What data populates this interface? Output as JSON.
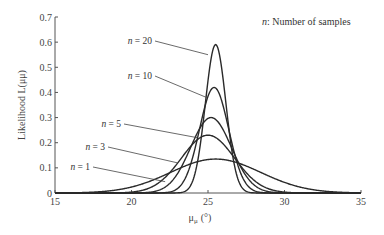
{
  "chart_data": {
    "type": "line",
    "title": "",
    "annotation": "n: Number of samples",
    "annotation_italic": "n",
    "annotation_rest": ": Number of samples",
    "xlabel": "μμ (°)",
    "xlabel_main": "μ",
    "xlabel_sub": "μ",
    "xlabel_unit": "(°)",
    "ylabel": "Likelihood L(μμ)",
    "xlim": [
      15,
      35
    ],
    "ylim": [
      0,
      0.7
    ],
    "xticks": [
      "15",
      "20",
      "25",
      "30",
      "35"
    ],
    "yticks": [
      "0",
      "0.1",
      "0.2",
      "0.3",
      "0.4",
      "0.5",
      "0.6",
      "0.7"
    ],
    "grid": false,
    "legend": "inline labels",
    "series": [
      {
        "name": "n = 1",
        "center": 25.5,
        "peak": 0.135,
        "sigma": 2.95
      },
      {
        "name": "n = 3",
        "center": 25.0,
        "peak": 0.23,
        "sigma": 1.73
      },
      {
        "name": "n = 5",
        "center": 25.2,
        "peak": 0.3,
        "sigma": 1.33
      },
      {
        "name": "n = 10",
        "center": 25.4,
        "peak": 0.42,
        "sigma": 0.95
      },
      {
        "name": "n = 20",
        "center": 25.5,
        "peak": 0.59,
        "sigma": 0.67
      }
    ],
    "series_labels": [
      {
        "text": "n = 1",
        "lx": 90,
        "ly": 170,
        "ax": 22.2,
        "ay": 0.045
      },
      {
        "text": "n = 3",
        "lx": 105,
        "ly": 150,
        "ax": 23.0,
        "ay": 0.12
      },
      {
        "text": "n = 5",
        "lx": 121,
        "ly": 127,
        "ax": 24.3,
        "ay": 0.22
      },
      {
        "text": "n = 10",
        "lx": 152,
        "ly": 79,
        "ax": 24.9,
        "ay": 0.38
      },
      {
        "text": "n = 20",
        "lx": 152,
        "ly": 44,
        "ax": 25.0,
        "ay": 0.55
      }
    ]
  }
}
